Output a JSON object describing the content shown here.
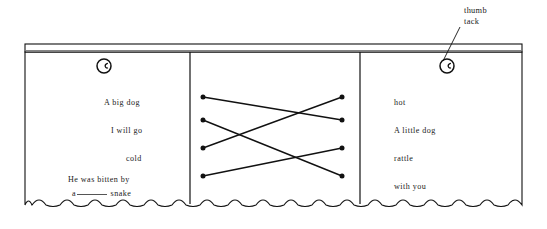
{
  "figure": {
    "colors": {
      "ink": "#1a1a1a",
      "line": "#111111",
      "paper": "#ffffff",
      "rail_shade": "#8a8a8a"
    }
  },
  "callout": {
    "line1": "thumb",
    "line2": "tack",
    "target": "thumbtack-right"
  },
  "thumbtacks": [
    {
      "name": "thumbtack-left",
      "cx": 104,
      "cy": 66,
      "r": 7
    },
    {
      "name": "thumbtack-right",
      "cx": 447,
      "cy": 66,
      "r": 7
    }
  ],
  "panels": {
    "left": {
      "name": "left-panel",
      "items": [
        {
          "text": "A big dog",
          "x": 104,
          "y": 99
        },
        {
          "text": "I will go",
          "x": 111,
          "y": 127
        },
        {
          "text": "cold",
          "x": 126,
          "y": 155
        },
        {
          "text": "He was bitten by",
          "x": 68,
          "y": 176
        }
      ],
      "last_line": {
        "prefix": "a",
        "blank": "",
        "suffix": "snake",
        "x": 72,
        "y": 190
      }
    },
    "middle": {
      "name": "matching-panel",
      "left_dots": [
        {
          "id": "L1",
          "x": 203,
          "y": 97
        },
        {
          "id": "L2",
          "x": 203,
          "y": 120
        },
        {
          "id": "L3",
          "x": 203,
          "y": 148
        },
        {
          "id": "L4",
          "x": 203,
          "y": 176
        }
      ],
      "right_dots": [
        {
          "id": "R1",
          "x": 342,
          "y": 97
        },
        {
          "id": "R2",
          "x": 342,
          "y": 120
        },
        {
          "id": "R3",
          "x": 342,
          "y": 148
        },
        {
          "id": "R4",
          "x": 342,
          "y": 176
        }
      ],
      "connections": [
        {
          "from": "L1",
          "to": "R2"
        },
        {
          "from": "L2",
          "to": "R4"
        },
        {
          "from": "L3",
          "to": "R1"
        },
        {
          "from": "L4",
          "to": "R3"
        }
      ]
    },
    "right": {
      "name": "right-panel",
      "items": [
        {
          "text": "hot",
          "x": 394,
          "y": 99
        },
        {
          "text": "A little dog",
          "x": 394,
          "y": 127
        },
        {
          "text": "rattle",
          "x": 394,
          "y": 155
        },
        {
          "text": "with you",
          "x": 394,
          "y": 183
        }
      ]
    }
  },
  "frame": {
    "left_edge": 25,
    "right_edge": 522,
    "rail_top": 44,
    "rail_bottom": 52,
    "body_bottom": 205,
    "dividers": [
      190,
      360
    ],
    "wave_amplitude": 5,
    "wave_length": 14
  }
}
